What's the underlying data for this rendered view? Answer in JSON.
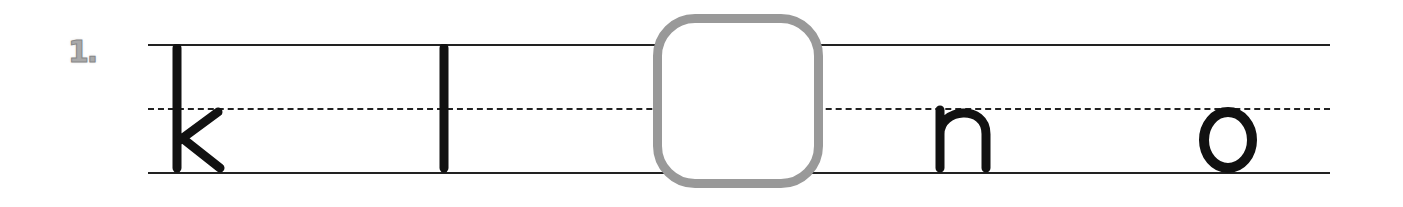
{
  "exercise": {
    "number": "1.",
    "letters": [
      "k",
      "l",
      "",
      "n",
      "o"
    ],
    "blank_index": 2,
    "colors": {
      "ink": "#111111",
      "blank_border": "#999999",
      "number": "#a9a9a9"
    }
  }
}
